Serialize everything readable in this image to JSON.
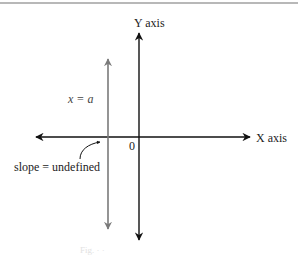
{
  "diagram": {
    "type": "coordinate-plane",
    "y_axis_label": "Y axis",
    "x_axis_label": "X axis",
    "origin_label": "0",
    "vertical_line_label": "x = a",
    "annotation": "slope = undefined",
    "caption_faint": "Fig.   ·   ·",
    "colors": {
      "axes": "#111111",
      "vertical_line": "#7a7a7a",
      "top_rule": "#b8b8b8",
      "text": "#222222"
    }
  }
}
